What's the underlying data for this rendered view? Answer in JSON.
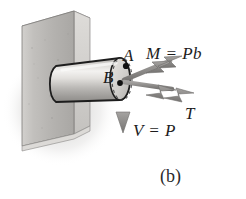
{
  "figure": {
    "caption": "(b)",
    "colors": {
      "background": "#ffffff",
      "wall_face": "#b9b7b4",
      "wall_top": "#d8d6d3",
      "wall_side": "#cfcdca",
      "bar_light": "#efeeec",
      "bar_mid": "#c9c7c4",
      "bar_dark": "#9b9996",
      "outline": "#1d1d1d",
      "arrow": "#8d8c8a",
      "arrow_outline": "#6e6d6b",
      "text": "#1d1d1d"
    },
    "points": [
      {
        "name": "A",
        "label": "A",
        "x": 126,
        "y": 66
      },
      {
        "name": "B",
        "label": "B",
        "x": 120,
        "y": 83
      }
    ],
    "vectors": [
      {
        "name": "moment",
        "label": "M = Pb",
        "arrow_style": "double-headed",
        "direction": "up-right",
        "from": {
          "x": 124,
          "y": 80
        },
        "to": {
          "x": 180,
          "y": 57
        }
      },
      {
        "name": "torque",
        "label": "T",
        "arrow_style": "double-headed",
        "direction": "right-down",
        "from": {
          "x": 124,
          "y": 82
        },
        "to": {
          "x": 192,
          "y": 92
        }
      },
      {
        "name": "shear",
        "label": "V = P",
        "arrow_style": "single-headed",
        "direction": "down",
        "from": {
          "x": 123,
          "y": 83
        },
        "to": {
          "x": 123,
          "y": 132
        }
      }
    ]
  }
}
